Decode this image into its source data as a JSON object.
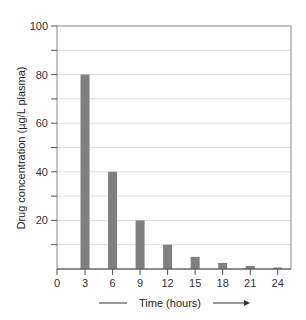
{
  "chart_data": {
    "type": "bar",
    "title": "",
    "xlabel": "Time (hours)",
    "ylabel": "Drug concentration (µg/L plasma)",
    "x_ticks": [
      0,
      3,
      6,
      9,
      12,
      15,
      18,
      21,
      24
    ],
    "y_ticks": [
      20,
      40,
      60,
      80,
      100
    ],
    "ylim": [
      0,
      100
    ],
    "xlim": [
      0,
      25.5
    ],
    "grid": true,
    "categories": [
      3,
      6,
      9,
      12,
      15,
      18,
      21,
      24
    ],
    "values": [
      80,
      40,
      20,
      10,
      5,
      2.5,
      1.25,
      0.6
    ],
    "colors": {
      "bar": "#7f7f7f",
      "axis": "#555555",
      "grid": "#dddddd"
    }
  }
}
